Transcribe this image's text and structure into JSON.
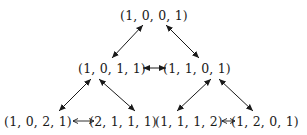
{
  "diagram": {
    "nodes": [
      {
        "id": "n1001",
        "label": "(1, 0, 0, 1)",
        "x": 154,
        "y": 15
      },
      {
        "id": "n1011",
        "label": "(1, 0, 1, 1)",
        "x": 112,
        "y": 68
      },
      {
        "id": "n1101",
        "label": "(1, 1, 0, 1)",
        "x": 197,
        "y": 68
      },
      {
        "id": "n1021",
        "label": "(1, 0, 2, 1)",
        "x": 38,
        "y": 121
      },
      {
        "id": "n2111",
        "label": "(2, 1, 1, 1)",
        "x": 123,
        "y": 121
      },
      {
        "id": "n1112",
        "label": "(1, 1, 1, 2)",
        "x": 188,
        "y": 121
      },
      {
        "id": "n1201",
        "label": "(1, 2, 0, 1)",
        "x": 265,
        "y": 121
      }
    ],
    "edges": [
      {
        "from": "n1001",
        "to": "n1011",
        "type": "bidirectional"
      },
      {
        "from": "n1001",
        "to": "n1101",
        "type": "bidirectional"
      },
      {
        "from": "n1011",
        "to": "n1101",
        "type": "bidirectional-long"
      },
      {
        "from": "n1011",
        "to": "n1021",
        "type": "bidirectional"
      },
      {
        "from": "n1011",
        "to": "n2111",
        "type": "bidirectional"
      },
      {
        "from": "n1101",
        "to": "n1112",
        "type": "bidirectional"
      },
      {
        "from": "n1101",
        "to": "n1201",
        "type": "bidirectional"
      },
      {
        "from": "n1021",
        "to": "n2111",
        "type": "longleftrightarrow"
      },
      {
        "from": "n1112",
        "to": "n1201",
        "type": "longleftrightarrow"
      }
    ],
    "colors": {
      "ink": "#1a1a1a",
      "background": "#ffffff"
    }
  }
}
